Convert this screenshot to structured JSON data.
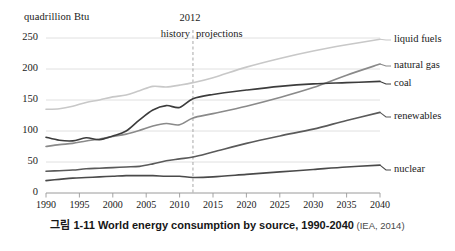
{
  "caption": {
    "figure_number": "그림 1-11",
    "title": "World energy consumption by source, 1990-2040",
    "source": "(IEA, 2014)"
  },
  "chart_data": {
    "type": "line",
    "title": "World energy consumption by source, 1990-2040",
    "xlabel": "",
    "ylabel": "quadrillion Btu",
    "unit_label": "quadrillion Btu",
    "xlim": [
      1990,
      2040
    ],
    "ylim": [
      0,
      250
    ],
    "yticks": [
      0,
      50,
      100,
      150,
      200,
      250
    ],
    "xticks": [
      1990,
      1995,
      2000,
      2005,
      2010,
      2015,
      2020,
      2025,
      2030,
      2035,
      2040
    ],
    "grid": "horizontal",
    "legend_position": "right-inline-labels",
    "annotations": {
      "divider_year": "2012",
      "divider_value": 2012,
      "left_region": "history",
      "right_region": "projections"
    },
    "x": [
      1990,
      1992,
      1994,
      1996,
      1998,
      2000,
      2002,
      2004,
      2006,
      2008,
      2010,
      2012,
      2015,
      2020,
      2025,
      2030,
      2035,
      2040
    ],
    "series": [
      {
        "name": "liquid fuels",
        "color": "#c8c8c8",
        "values": [
          135,
          136,
          140,
          146,
          150,
          155,
          158,
          165,
          172,
          171,
          174,
          178,
          186,
          203,
          217,
          229,
          239,
          248
        ]
      },
      {
        "name": "natural gas",
        "color": "#8a8a8a",
        "values": [
          75,
          78,
          80,
          84,
          87,
          91,
          95,
          101,
          108,
          112,
          110,
          121,
          128,
          140,
          154,
          170,
          190,
          208
        ]
      },
      {
        "name": "coal",
        "color": "#3c3c3c",
        "values": [
          90,
          85,
          84,
          89,
          86,
          92,
          100,
          118,
          134,
          141,
          138,
          152,
          159,
          166,
          172,
          176,
          178,
          180
        ]
      },
      {
        "name": "renewables",
        "color": "#5a5a5a",
        "values": [
          35,
          36,
          37,
          39,
          40,
          41,
          42,
          43,
          47,
          52,
          55,
          58,
          66,
          80,
          92,
          103,
          117,
          130
        ]
      },
      {
        "name": "nuclear",
        "color": "#4a4a4a",
        "values": [
          20,
          22,
          24,
          25,
          26,
          27,
          28,
          28,
          28,
          27,
          27,
          25,
          26,
          30,
          34,
          38,
          42,
          45
        ]
      }
    ]
  },
  "axis": {
    "unit_label": "quadrillion Btu",
    "y_tick_labels": [
      "250",
      "200",
      "150",
      "100",
      "50",
      "0"
    ],
    "x_tick_labels": [
      "1990",
      "1995",
      "2000",
      "2005",
      "2010",
      "2015",
      "2020",
      "2025",
      "2030",
      "2035",
      "2040"
    ]
  },
  "series_labels": {
    "liquid_fuels": "liquid fuels",
    "natural_gas": "natural gas",
    "coal": "coal",
    "renewables": "renewables",
    "nuclear": "nuclear"
  },
  "colors": {
    "liquid_fuels": "#c8c8c8",
    "natural_gas": "#8a8a8a",
    "coal": "#3c3c3c",
    "renewables": "#5a5a5a",
    "nuclear": "#4a4a4a",
    "grid": "#dcdcdc",
    "axis": "#9a9a9a",
    "divider": "#a8a8a8"
  }
}
